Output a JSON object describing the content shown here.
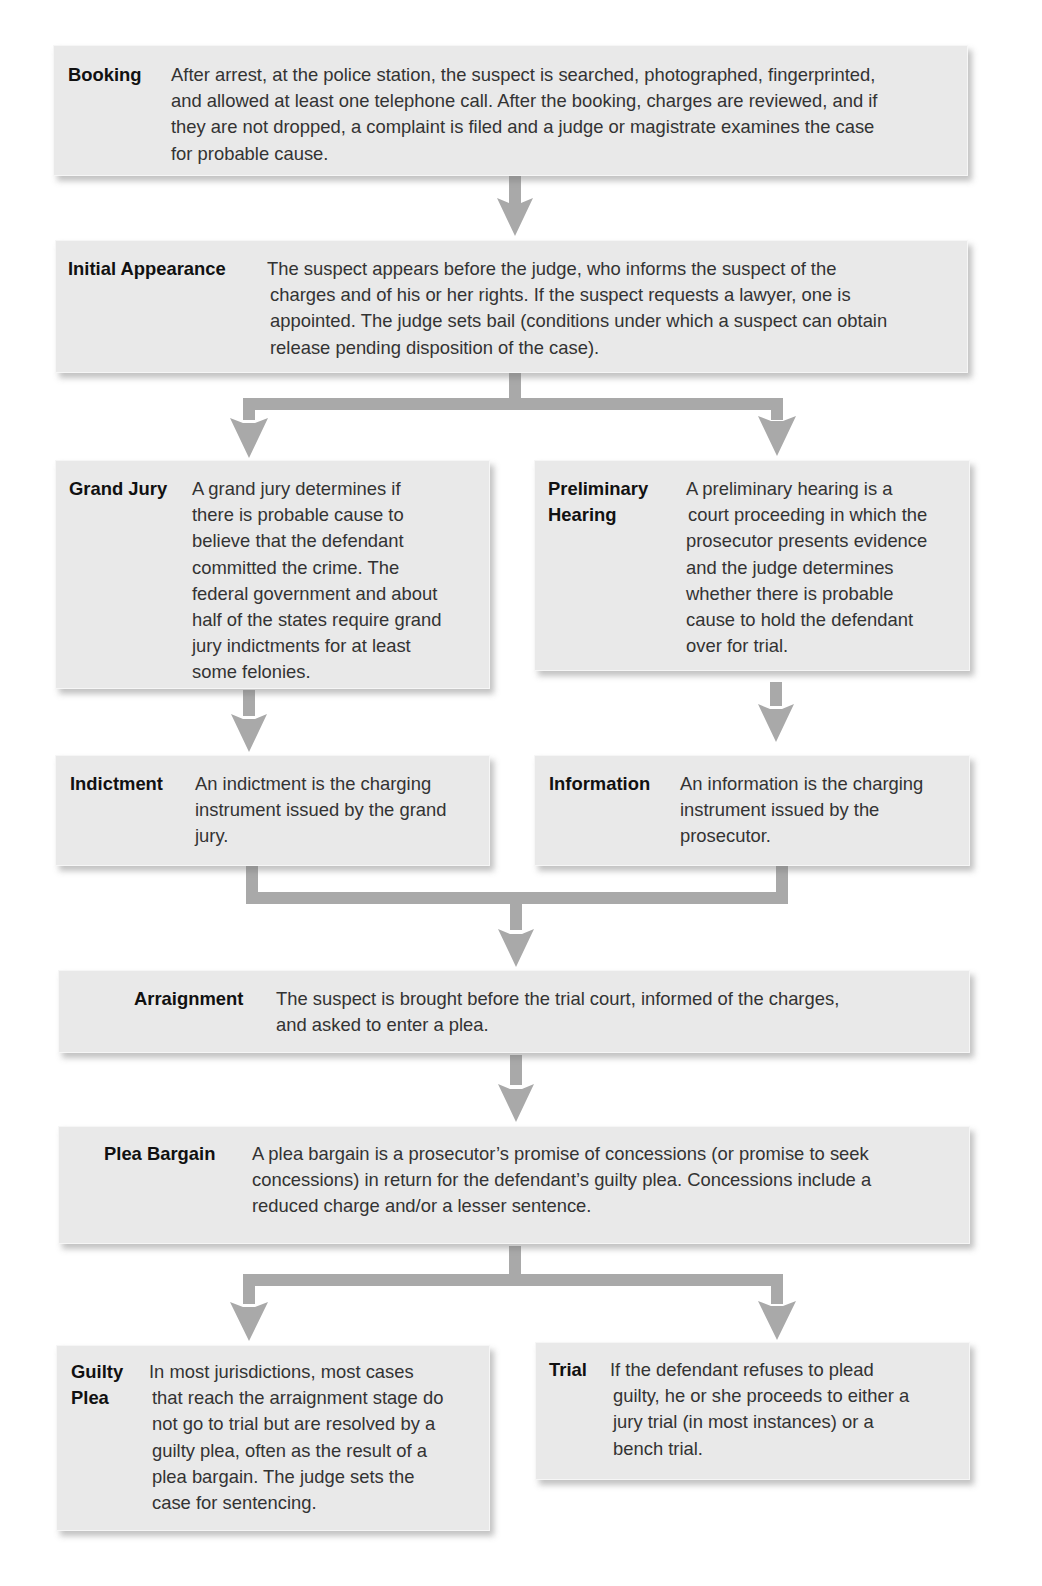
{
  "diagram": {
    "type": "flowchart",
    "title_visible": false,
    "colors": {
      "box_fill": "#e9e9e9",
      "arrow": "#a9a9a9",
      "term_text": "#111111",
      "body_text": "#333333"
    },
    "steps": {
      "booking": {
        "term": "Booking",
        "lines": [
          "After arrest, at the police station, the suspect is searched, photographed, fingerprinted,",
          "and allowed at least one telephone call. After the booking, charges are reviewed, and if",
          "they are not dropped, a complaint is filed and a judge or magistrate examines the case",
          "for probable cause."
        ]
      },
      "initial_appearance": {
        "term": "Initial Appearance",
        "lines": [
          "The suspect appears before the judge, who informs the suspect of the",
          "charges and of his or her rights. If the suspect requests a lawyer, one is",
          "appointed. The judge sets bail (conditions under which a suspect can obtain",
          "release pending disposition of the case)."
        ]
      },
      "grand_jury": {
        "term": "Grand Jury",
        "lines": [
          "A grand jury determines if",
          "there is probable cause to",
          "believe that the defendant",
          "committed the crime. The",
          "federal government and about",
          "half of the states require grand",
          "jury indictments for at least",
          "some felonies."
        ]
      },
      "preliminary_hearing": {
        "term": "Preliminary\nHearing",
        "lines": [
          "A preliminary hearing is a",
          "court proceeding in which the",
          "prosecutor presents evidence",
          "and the judge determines",
          "whether there is probable",
          "cause to hold the  defendant",
          "over for trial."
        ]
      },
      "indictment": {
        "term": "Indictment",
        "lines": [
          "An indictment is the charging",
          "instrument issued by the grand",
          "jury."
        ]
      },
      "information": {
        "term": "Information",
        "lines": [
          "An information is the charging",
          "instrument issued by the",
          "prosecutor."
        ]
      },
      "arraignment": {
        "term": "Arraignment",
        "lines": [
          "The suspect is brought before the trial court, informed of the charges,",
          "and asked to enter a plea."
        ]
      },
      "plea_bargain": {
        "term": "Plea Bargain",
        "lines": [
          "A plea bargain is a prosecutor’s promise of concessions (or promise to seek",
          "concessions) in return for the defendant’s guilty plea. Concessions include a",
          "reduced charge and/or a lesser sentence."
        ]
      },
      "guilty_plea": {
        "term": "Guilty\nPlea",
        "lines": [
          "In most jurisdictions, most cases",
          "that reach the arraignment stage do",
          "not go to trial but are resolved by a",
          "guilty plea, often as the result of a",
          "plea bargain. The judge sets the",
          "case for sentencing."
        ]
      },
      "trial": {
        "term": "Trial",
        "lines": [
          "If the defendant refuses to plead",
          "guilty, he or she proceeds to either a",
          "jury trial (in most instances) or a",
          "bench trial."
        ]
      }
    },
    "flow": [
      [
        "Booking",
        "Initial Appearance"
      ],
      [
        "Initial Appearance",
        "Grand Jury"
      ],
      [
        "Initial Appearance",
        "Preliminary Hearing"
      ],
      [
        "Grand Jury",
        "Indictment"
      ],
      [
        "Preliminary Hearing",
        "Information"
      ],
      [
        "Indictment",
        "Arraignment"
      ],
      [
        "Information",
        "Arraignment"
      ],
      [
        "Arraignment",
        "Plea Bargain"
      ],
      [
        "Plea Bargain",
        "Guilty Plea"
      ],
      [
        "Plea Bargain",
        "Trial"
      ]
    ]
  }
}
